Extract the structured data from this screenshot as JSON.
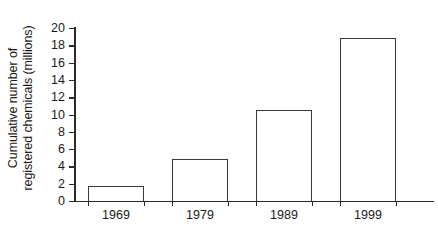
{
  "chart_data": {
    "type": "bar",
    "title": "",
    "subtitle": "",
    "categories": [
      "1969",
      "1979",
      "1989",
      "1999"
    ],
    "values": [
      1.7,
      4.85,
      10.5,
      18.8
    ],
    "xlabel": "",
    "ylabel_lines": [
      "Cumulative number of",
      "registered chemicals (millions)"
    ],
    "ylabel": "Cumulative number of registered chemicals (millions)",
    "ylim": [
      0,
      20
    ],
    "yticks": [
      0,
      2,
      4,
      6,
      8,
      10,
      12,
      14,
      16,
      18,
      20
    ],
    "ytick_labels": [
      "0",
      "2",
      "4",
      "6",
      "8",
      "10",
      "12",
      "14",
      "16",
      "18",
      "20"
    ],
    "grid": false,
    "legend": null,
    "bar_fill_color": "#ffffff",
    "bar_edge_color": "#3a3a3a",
    "axis_color": "#2a2a2a",
    "background_color": "#ffffff"
  }
}
